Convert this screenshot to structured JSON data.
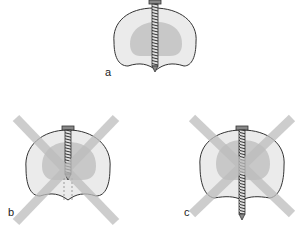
{
  "figure": {
    "panels": [
      {
        "id": "a",
        "label": "a",
        "state": "correct",
        "screw": "partial-length"
      },
      {
        "id": "b",
        "label": "b",
        "state": "incorrect",
        "screw": "short",
        "crossed_out": true
      },
      {
        "id": "c",
        "label": "c",
        "state": "incorrect",
        "screw": "too-long",
        "crossed_out": true
      }
    ],
    "colors": {
      "outline": "#333333",
      "cortex_fill": "#ebebeb",
      "cancellous_fill": "#c8c8c8",
      "cross": "#bdbdbd",
      "screw": "#555555"
    }
  }
}
